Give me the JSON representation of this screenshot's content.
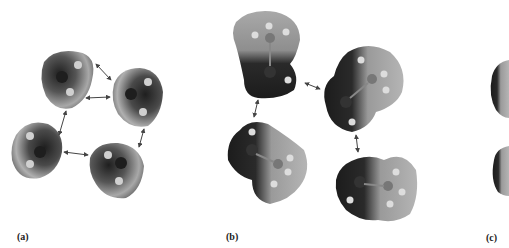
{
  "figure": {
    "panels": [
      {
        "id": "a",
        "label": "(a)",
        "description": "Four water-like bent molecules with electrostatic potential surfaces, connected by double-headed arrows in a ring"
      },
      {
        "id": "b",
        "label": "(b)",
        "description": "Four methanol-like molecules with electrostatic potential surfaces, connected by double-headed arrows"
      },
      {
        "id": "c",
        "label": "(c)",
        "description": "Partially visible molecules cropped at right edge"
      }
    ],
    "colors": {
      "background": "#ffffff",
      "surface_dark": "#2a2a2a",
      "surface_light": "#b8b8b8",
      "arrow": "#444444",
      "atom_center": "#1e1e1e",
      "atom_h": "#d8d8d8"
    }
  }
}
